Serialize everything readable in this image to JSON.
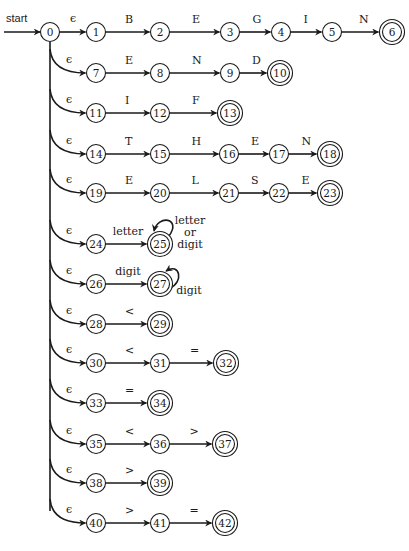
{
  "diagram": {
    "start_label": "start",
    "start_state": "0",
    "epsilon_symbol": "ϵ",
    "colors": {
      "ink": "#1a1a1a",
      "background": "#ffffff"
    },
    "states": [
      {
        "id": "0",
        "x": 50,
        "y": 32,
        "accepting": false
      },
      {
        "id": "1",
        "x": 96,
        "y": 32,
        "accepting": false
      },
      {
        "id": "2",
        "x": 160,
        "y": 32,
        "accepting": false
      },
      {
        "id": "3",
        "x": 230,
        "y": 32,
        "accepting": false
      },
      {
        "id": "4",
        "x": 281,
        "y": 32,
        "accepting": false
      },
      {
        "id": "5",
        "x": 332,
        "y": 32,
        "accepting": false
      },
      {
        "id": "6",
        "x": 392,
        "y": 32,
        "accepting": true
      },
      {
        "id": "7",
        "x": 96,
        "y": 73,
        "accepting": false
      },
      {
        "id": "8",
        "x": 160,
        "y": 73,
        "accepting": false
      },
      {
        "id": "9",
        "x": 230,
        "y": 73,
        "accepting": false
      },
      {
        "id": "10",
        "x": 280,
        "y": 73,
        "accepting": true
      },
      {
        "id": "11",
        "x": 96,
        "y": 113,
        "accepting": false
      },
      {
        "id": "12",
        "x": 160,
        "y": 113,
        "accepting": false
      },
      {
        "id": "13",
        "x": 230,
        "y": 113,
        "accepting": true
      },
      {
        "id": "14",
        "x": 96,
        "y": 154,
        "accepting": false
      },
      {
        "id": "15",
        "x": 160,
        "y": 154,
        "accepting": false
      },
      {
        "id": "16",
        "x": 229,
        "y": 154,
        "accepting": false
      },
      {
        "id": "17",
        "x": 279,
        "y": 154,
        "accepting": false
      },
      {
        "id": "18",
        "x": 330,
        "y": 154,
        "accepting": true
      },
      {
        "id": "19",
        "x": 96,
        "y": 193,
        "accepting": false
      },
      {
        "id": "20",
        "x": 160,
        "y": 193,
        "accepting": false
      },
      {
        "id": "21",
        "x": 229,
        "y": 193,
        "accepting": false
      },
      {
        "id": "22",
        "x": 279,
        "y": 193,
        "accepting": false
      },
      {
        "id": "23",
        "x": 330,
        "y": 193,
        "accepting": true
      },
      {
        "id": "24",
        "x": 96,
        "y": 244,
        "accepting": false
      },
      {
        "id": "25",
        "x": 160,
        "y": 244,
        "accepting": true
      },
      {
        "id": "26",
        "x": 96,
        "y": 284,
        "accepting": false
      },
      {
        "id": "27",
        "x": 160,
        "y": 284,
        "accepting": true
      },
      {
        "id": "28",
        "x": 96,
        "y": 324,
        "accepting": false
      },
      {
        "id": "29",
        "x": 160,
        "y": 324,
        "accepting": true
      },
      {
        "id": "30",
        "x": 96,
        "y": 363,
        "accepting": false
      },
      {
        "id": "31",
        "x": 160,
        "y": 363,
        "accepting": false
      },
      {
        "id": "32",
        "x": 226,
        "y": 363,
        "accepting": true
      },
      {
        "id": "33",
        "x": 96,
        "y": 403,
        "accepting": false
      },
      {
        "id": "34",
        "x": 160,
        "y": 403,
        "accepting": true
      },
      {
        "id": "35",
        "x": 96,
        "y": 444,
        "accepting": false
      },
      {
        "id": "36",
        "x": 160,
        "y": 444,
        "accepting": false
      },
      {
        "id": "37",
        "x": 225,
        "y": 444,
        "accepting": true
      },
      {
        "id": "38",
        "x": 96,
        "y": 483,
        "accepting": false
      },
      {
        "id": "39",
        "x": 160,
        "y": 483,
        "accepting": true
      },
      {
        "id": "40",
        "x": 96,
        "y": 523,
        "accepting": false
      },
      {
        "id": "41",
        "x": 160,
        "y": 523,
        "accepting": false
      },
      {
        "id": "42",
        "x": 225,
        "y": 523,
        "accepting": true
      }
    ],
    "transitions": [
      {
        "from": "0",
        "to": "1",
        "label": "ϵ"
      },
      {
        "from": "1",
        "to": "2",
        "label": "B"
      },
      {
        "from": "2",
        "to": "3",
        "label": "E"
      },
      {
        "from": "3",
        "to": "4",
        "label": "G"
      },
      {
        "from": "4",
        "to": "5",
        "label": "I"
      },
      {
        "from": "5",
        "to": "6",
        "label": "N"
      },
      {
        "from": "0",
        "to": "7",
        "label": "ϵ"
      },
      {
        "from": "7",
        "to": "8",
        "label": "E"
      },
      {
        "from": "8",
        "to": "9",
        "label": "N"
      },
      {
        "from": "9",
        "to": "10",
        "label": "D"
      },
      {
        "from": "0",
        "to": "11",
        "label": "ϵ"
      },
      {
        "from": "11",
        "to": "12",
        "label": "I"
      },
      {
        "from": "12",
        "to": "13",
        "label": "F"
      },
      {
        "from": "0",
        "to": "14",
        "label": "ϵ"
      },
      {
        "from": "14",
        "to": "15",
        "label": "T"
      },
      {
        "from": "15",
        "to": "16",
        "label": "H"
      },
      {
        "from": "16",
        "to": "17",
        "label": "E"
      },
      {
        "from": "17",
        "to": "18",
        "label": "N"
      },
      {
        "from": "0",
        "to": "19",
        "label": "ϵ"
      },
      {
        "from": "19",
        "to": "20",
        "label": "E"
      },
      {
        "from": "20",
        "to": "21",
        "label": "L"
      },
      {
        "from": "21",
        "to": "22",
        "label": "S"
      },
      {
        "from": "22",
        "to": "23",
        "label": "E"
      },
      {
        "from": "0",
        "to": "24",
        "label": "ϵ"
      },
      {
        "from": "24",
        "to": "25",
        "label": "letter"
      },
      {
        "from": "25",
        "to": "25",
        "label": "letter or digit"
      },
      {
        "from": "0",
        "to": "26",
        "label": "ϵ"
      },
      {
        "from": "26",
        "to": "27",
        "label": "digit"
      },
      {
        "from": "27",
        "to": "27",
        "label": "digit"
      },
      {
        "from": "0",
        "to": "28",
        "label": "ϵ"
      },
      {
        "from": "28",
        "to": "29",
        "label": "<"
      },
      {
        "from": "0",
        "to": "30",
        "label": "ϵ"
      },
      {
        "from": "30",
        "to": "31",
        "label": "<"
      },
      {
        "from": "31",
        "to": "32",
        "label": "="
      },
      {
        "from": "0",
        "to": "33",
        "label": "ϵ"
      },
      {
        "from": "33",
        "to": "34",
        "label": "="
      },
      {
        "from": "0",
        "to": "35",
        "label": "ϵ"
      },
      {
        "from": "35",
        "to": "36",
        "label": "<"
      },
      {
        "from": "36",
        "to": "37",
        "label": ">"
      },
      {
        "from": "0",
        "to": "38",
        "label": "ϵ"
      },
      {
        "from": "38",
        "to": "39",
        "label": ">"
      },
      {
        "from": "0",
        "to": "40",
        "label": "ϵ"
      },
      {
        "from": "40",
        "to": "41",
        "label": ">"
      },
      {
        "from": "41",
        "to": "42",
        "label": "="
      }
    ],
    "self_loop_labels": {
      "s25": [
        "letter",
        "or",
        "digit"
      ],
      "s27": [
        "digit"
      ]
    }
  }
}
